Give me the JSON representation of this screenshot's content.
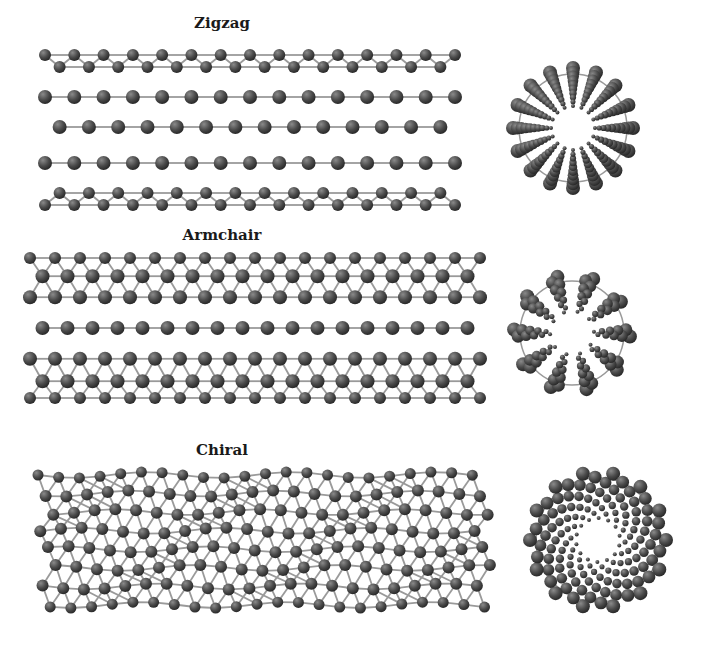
{
  "figure": {
    "colors": {
      "atom": "#4a4a4a",
      "atom_highlight": "#8a8a8a",
      "bond": "#9a9a9a",
      "background": "#ffffff"
    },
    "nanotubes": [
      {
        "id": "zigzag",
        "label": "Zigzag",
        "label_pos": {
          "x": 222,
          "y": 14
        },
        "side_view": {
          "x": 45,
          "y": 55,
          "width": 410,
          "height": 150,
          "lattice": "zigzag"
        },
        "end_view": {
          "cx": 573,
          "cy": 128,
          "r_outer": 60,
          "r_inner": 22,
          "spokes": 16,
          "style": "radial"
        }
      },
      {
        "id": "armchair",
        "label": "Armchair",
        "label_pos": {
          "x": 222,
          "y": 226
        },
        "side_view": {
          "x": 30,
          "y": 258,
          "width": 450,
          "height": 140,
          "lattice": "armchair"
        },
        "end_view": {
          "cx": 572,
          "cy": 333,
          "r_outer": 58,
          "r_inner": 22,
          "spokes": 10,
          "style": "blades"
        }
      },
      {
        "id": "chiral",
        "label": "Chiral",
        "label_pos": {
          "x": 222,
          "y": 441
        },
        "side_view": {
          "x": 38,
          "y": 475,
          "width": 455,
          "height": 130,
          "lattice": "chiral"
        },
        "end_view": {
          "cx": 598,
          "cy": 540,
          "r_outer": 68,
          "r_inner": 22,
          "spokes": 14,
          "style": "spiral"
        }
      }
    ]
  }
}
